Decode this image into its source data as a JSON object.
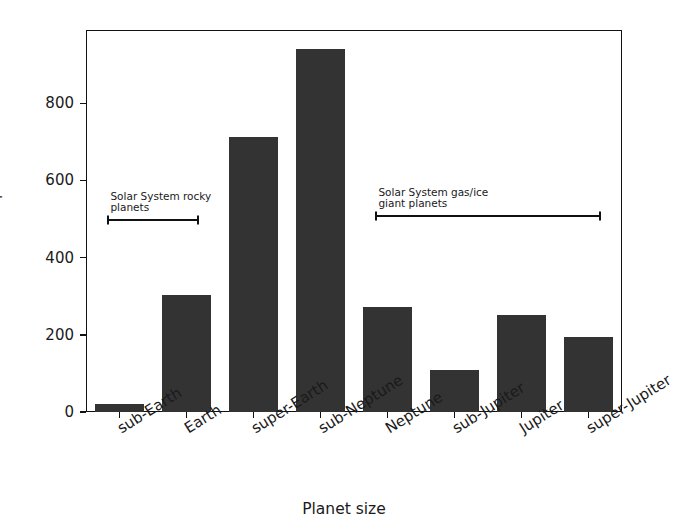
{
  "chart_data": {
    "type": "bar",
    "title": "",
    "xlabel": "Planet size",
    "ylabel": "Number of planets",
    "categories": [
      "sub-Earth",
      "Earth",
      "super-Earth",
      "sub-Neptune",
      "Neptune",
      "sub-Jupiter",
      "Jupiter",
      "super-Jupiter"
    ],
    "values": [
      22,
      302,
      712,
      940,
      272,
      108,
      252,
      195
    ],
    "yticks": [
      0,
      200,
      400,
      600,
      800
    ],
    "ytick_labels": [
      "0",
      "200",
      "400",
      "600",
      "800"
    ],
    "ylim": [
      0,
      990
    ],
    "grid": false,
    "legend": false,
    "bar_color": "#333333",
    "axis_color": "#111111",
    "annotations": [
      {
        "text": "Solar System rocky\nplanets",
        "span_start_category": "sub-Earth",
        "span_end_category": "Earth",
        "y_value": 500
      },
      {
        "text": "Solar System gas/ice\ngiant planets",
        "span_start_category": "Neptune",
        "span_end_category": "super-Jupiter",
        "y_value": 510
      }
    ]
  },
  "axes": {
    "ylabel": "Number of planets",
    "xlabel": "Planet size"
  }
}
